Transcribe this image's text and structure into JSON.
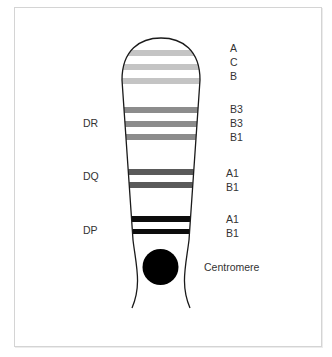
{
  "diagram": {
    "type": "chromosome-banding",
    "colors": {
      "outline": "#1a1a1a",
      "band_light": "#c4c4c4",
      "band_medium": "#8c8c8c",
      "band_dark": "#5a5a5a",
      "band_black": "#0d0d0d",
      "centromere": "#000000",
      "frame": "#d4d4d4",
      "text": "#333333"
    },
    "left_labels": [
      {
        "text": "DR",
        "y": 117
      },
      {
        "text": "DQ",
        "y": 170
      },
      {
        "text": "DP",
        "y": 224
      }
    ],
    "right_labels": [
      {
        "text": "A",
        "y": 42
      },
      {
        "text": "C",
        "y": 56
      },
      {
        "text": "B",
        "y": 70
      },
      {
        "text": "B3",
        "y": 103
      },
      {
        "text": "B3",
        "y": 117
      },
      {
        "text": "B1",
        "y": 131
      },
      {
        "text": "A1",
        "y": 167
      },
      {
        "text": "B1",
        "y": 181
      },
      {
        "text": "A1",
        "y": 213
      },
      {
        "text": "B1",
        "y": 227
      }
    ],
    "centromere_label": "Centromere",
    "bands": [
      {
        "region": "top",
        "label": "A",
        "shade": "light",
        "y": 53
      },
      {
        "region": "top",
        "label": "C",
        "shade": "light",
        "y": 67
      },
      {
        "region": "top",
        "label": "B",
        "shade": "light",
        "y": 81
      },
      {
        "region": "DR",
        "label": "B3",
        "shade": "medium",
        "y": 110
      },
      {
        "region": "DR",
        "label": "B3",
        "shade": "medium",
        "y": 124
      },
      {
        "region": "DR",
        "label": "B1",
        "shade": "medium",
        "y": 137
      },
      {
        "region": "DQ",
        "label": "A1",
        "shade": "dark",
        "y": 172
      },
      {
        "region": "DQ",
        "label": "B1",
        "shade": "dark",
        "y": 185
      },
      {
        "region": "DP",
        "label": "A1",
        "shade": "black",
        "y": 219
      },
      {
        "region": "DP",
        "label": "B1",
        "shade": "black",
        "y": 232
      }
    ]
  }
}
